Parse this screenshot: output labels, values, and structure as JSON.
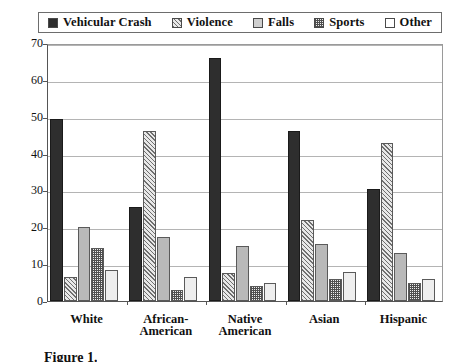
{
  "chart_data": {
    "type": "bar",
    "title": "",
    "xlabel": "",
    "ylabel": "",
    "ylim": [
      0,
      70
    ],
    "yticks": [
      0,
      10,
      20,
      30,
      40,
      50,
      60,
      70
    ],
    "grid": true,
    "legend_position": "top",
    "categories": [
      "White",
      "African-\nAmerican",
      "Native\nAmerican",
      "Asian",
      "Hispanic"
    ],
    "series": [
      {
        "name": "Vehicular Crash",
        "pattern": "solid-dark",
        "values": [
          49.5,
          25.5,
          66.0,
          46.0,
          30.5
        ]
      },
      {
        "name": "Violence",
        "pattern": "diagonal-hatch",
        "values": [
          6.5,
          46.0,
          7.5,
          22.0,
          43.0
        ]
      },
      {
        "name": "Falls",
        "pattern": "solid-gray",
        "values": [
          20.0,
          17.5,
          15.0,
          15.5,
          13.0
        ]
      },
      {
        "name": "Sports",
        "pattern": "checkerboard",
        "values": [
          14.5,
          3.0,
          4.0,
          6.0,
          5.0
        ]
      },
      {
        "name": "Other",
        "pattern": "solid-white",
        "values": [
          8.5,
          6.5,
          5.0,
          8.0,
          6.0
        ]
      }
    ]
  },
  "legend": {
    "items": [
      {
        "label": "Vehicular Crash"
      },
      {
        "label": "Violence"
      },
      {
        "label": "Falls"
      },
      {
        "label": "Sports"
      },
      {
        "label": "Other"
      }
    ]
  },
  "axis": {
    "y_tick_labels": [
      "70",
      "60",
      "50",
      "40",
      "30",
      "20",
      "10",
      "0"
    ]
  },
  "caption": {
    "text": "Figure 1."
  }
}
